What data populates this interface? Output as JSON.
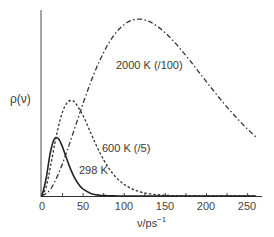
{
  "chart_data": {
    "type": "line",
    "title": "",
    "xlabel": "ν/ps⁻¹",
    "ylabel": "ρ(ν)",
    "xlim": [
      0,
      260
    ],
    "ylim": [
      0,
      3.2
    ],
    "y_units": "relative (298 K peak = 1)",
    "grid": false,
    "legend": "inline labels",
    "x_ticks": [
      0,
      50,
      100,
      150,
      200,
      250
    ],
    "x_minor_ticks": [
      25,
      75,
      125,
      175,
      225
    ],
    "series": [
      {
        "name": "298 K",
        "label": "298 K",
        "style": "solid",
        "x": [
          0,
          5,
          10,
          15,
          20,
          25,
          30,
          35,
          40,
          45,
          50,
          60,
          70,
          80,
          90,
          100,
          260
        ],
        "values": [
          0,
          0.297,
          0.734,
          0.972,
          0.978,
          0.834,
          0.637,
          0.451,
          0.3,
          0.191,
          0.117,
          0.04,
          0.013,
          0.004,
          0.001,
          0,
          0
        ]
      },
      {
        "name": "600 K (/5)",
        "label": "600 K (/5)",
        "style": "dashed",
        "x": [
          0,
          5,
          10,
          15,
          20,
          25,
          30,
          35,
          40,
          50,
          60,
          70,
          80,
          90,
          100,
          110,
          120,
          130,
          140,
          150,
          160,
          170,
          180,
          260
        ],
        "values": [
          0,
          0.15,
          0.48,
          0.855,
          1.19,
          1.438,
          1.584,
          1.632,
          1.6,
          1.371,
          1.054,
          0.749,
          0.501,
          0.32,
          0.197,
          0.118,
          0.069,
          0.039,
          0.022,
          0.012,
          0.006,
          0.003,
          0.002,
          0
        ]
      },
      {
        "name": "2000 K (/100)",
        "label": "2000 K (/100)",
        "style": "dash-dot",
        "x": [
          0,
          10,
          20,
          30,
          40,
          50,
          60,
          70,
          80,
          90,
          100,
          110,
          120,
          130,
          140,
          150,
          160,
          170,
          180,
          190,
          200,
          210,
          220,
          230,
          240,
          250,
          260
        ],
        "values": [
          0,
          0.108,
          0.382,
          0.753,
          1.167,
          1.585,
          1.972,
          2.31,
          2.586,
          2.795,
          2.933,
          3.008,
          3.022,
          2.984,
          2.903,
          2.788,
          2.645,
          2.484,
          2.312,
          2.132,
          1.952,
          1.774,
          1.602,
          1.439,
          1.285,
          1.142,
          1.01
        ]
      }
    ],
    "annotations": [
      {
        "text": "2000 K (/100)",
        "series": "2000 K (/100)"
      },
      {
        "text": "600 K (/5)",
        "series": "600 K (/5)"
      },
      {
        "text": "298 K",
        "series": "298 K"
      }
    ]
  },
  "labels": {
    "ylabel": "ρ(ν)",
    "xlabel_main": "ν/ps",
    "xlabel_sup": "−1",
    "series_2000": "2000 K (/100)",
    "series_600": "600 K (/5)",
    "series_298": "298 K",
    "ticks": [
      "0",
      "50",
      "100",
      "150",
      "200",
      "250"
    ]
  }
}
